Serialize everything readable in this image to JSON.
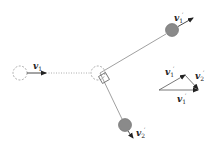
{
  "diagram": {
    "type": "elastic collision vector diagram",
    "colors": {
      "line": "#777777",
      "ball_fill": "#8a8a8a",
      "ball_stroke": "#666666",
      "dashed_circle": "#999999",
      "arrow": "#222222"
    },
    "labels": {
      "v1_initial": {
        "base": "v",
        "sub": "1",
        "sup": ""
      },
      "v1_final": {
        "base": "v",
        "sub": "1",
        "sup": "′"
      },
      "v2_final": {
        "base": "v",
        "sub": "2",
        "sup": "′"
      },
      "triangle_v1_final": {
        "base": "v",
        "sub": "1",
        "sup": "′"
      },
      "triangle_v2_final": {
        "base": "v",
        "sub": "2",
        "sup": "′"
      },
      "triangle_v1_base": {
        "base": "v",
        "sub": "1",
        "sup": "′"
      }
    },
    "elements": [
      "initial-ball-position (dashed circle)",
      "collision-point-ball (dashed circle)",
      "right-angle-marker",
      "ball-1-after-collision (gray)",
      "ball-2-after-collision (gray)",
      "vector-triangle"
    ]
  }
}
